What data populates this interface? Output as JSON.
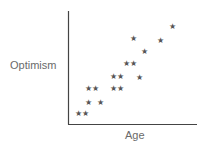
{
  "chart_data": {
    "type": "scatter",
    "title": "",
    "xlabel": "Age",
    "ylabel": "Optimism",
    "marker": "star",
    "grid": false,
    "legend": null,
    "axis_ticks": false,
    "points_px": [
      {
        "x": 78,
        "y": 114
      },
      {
        "x": 85,
        "y": 114
      },
      {
        "x": 88,
        "y": 103
      },
      {
        "x": 100,
        "y": 103
      },
      {
        "x": 88,
        "y": 89
      },
      {
        "x": 95,
        "y": 89
      },
      {
        "x": 113,
        "y": 89
      },
      {
        "x": 120,
        "y": 89
      },
      {
        "x": 113,
        "y": 77
      },
      {
        "x": 120,
        "y": 77
      },
      {
        "x": 139,
        "y": 78
      },
      {
        "x": 126,
        "y": 64
      },
      {
        "x": 133,
        "y": 64
      },
      {
        "x": 144,
        "y": 52
      },
      {
        "x": 133,
        "y": 39
      },
      {
        "x": 160,
        "y": 41
      },
      {
        "x": 172,
        "y": 27
      }
    ],
    "points": [
      {
        "x": 1.0,
        "y": 1.0
      },
      {
        "x": 1.5,
        "y": 1.0
      },
      {
        "x": 1.8,
        "y": 2.0
      },
      {
        "x": 2.6,
        "y": 2.0
      },
      {
        "x": 1.8,
        "y": 3.2
      },
      {
        "x": 2.3,
        "y": 3.2
      },
      {
        "x": 3.5,
        "y": 3.2
      },
      {
        "x": 4.0,
        "y": 3.2
      },
      {
        "x": 3.5,
        "y": 4.2
      },
      {
        "x": 4.0,
        "y": 4.2
      },
      {
        "x": 5.3,
        "y": 4.1
      },
      {
        "x": 4.4,
        "y": 5.3
      },
      {
        "x": 4.9,
        "y": 5.3
      },
      {
        "x": 5.7,
        "y": 6.4
      },
      {
        "x": 4.9,
        "y": 7.5
      },
      {
        "x": 6.8,
        "y": 7.3
      },
      {
        "x": 7.6,
        "y": 8.5
      }
    ],
    "axes": {
      "origin_px": [
        68,
        124
      ],
      "x_end_px": 197,
      "y_top_px": 11
    },
    "colors": {
      "marker": "#555555",
      "axis": "#444444",
      "label": "#6a6a6a"
    }
  },
  "labels": {
    "x_axis": "Age",
    "y_axis": "Optimism",
    "star_glyph": "★"
  }
}
